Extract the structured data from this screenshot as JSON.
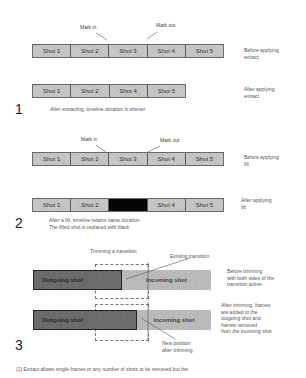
{
  "section1": {
    "number": "1",
    "mark_in": "Mark in",
    "mark_out": "Mark out",
    "before_shots": [
      "Shot 1",
      "Shot 2",
      "Shot 3",
      "Shot 4",
      "Shot 5"
    ],
    "before_label": [
      "Before applying",
      "extract"
    ],
    "after_shots": [
      "Shot 1",
      "Shot 2",
      "Shot 4",
      "Shot 5"
    ],
    "after_label": [
      "After applying",
      "extract"
    ],
    "caption": "After extracting, timeline duration is shorter"
  },
  "section2": {
    "number": "2",
    "mark_in": "Mark in",
    "mark_out": "Mark out",
    "before_shots": [
      "Shot 1",
      "Shot 2",
      "Shot 3",
      "Shot 4",
      "Shot 5"
    ],
    "before_label": [
      "Before applying",
      "lift"
    ],
    "after_shots": [
      "Shot 1",
      "Shot 2",
      "",
      "Shot 4",
      "Shot 5"
    ],
    "after_label": [
      "After applying",
      "lift"
    ],
    "caption": [
      "After a lift, timeline retains same duration",
      "The lifted shot is replaced with black"
    ]
  },
  "section3": {
    "number": "3",
    "trimming_label": "Trimming a transition",
    "existing_label": "Existing transition",
    "outgoing": "Outgoing shot",
    "incoming": "Incoming shot",
    "before_label": [
      "Before trimming",
      "with both sides of the",
      "transition active"
    ],
    "after_label": [
      "After trimming, frames",
      "are added to the",
      "outgoing shot and",
      "frames removed",
      "from the incoming shot"
    ],
    "new_position_label": [
      "New position",
      "after trimming"
    ]
  },
  "footnote": "(1) Extract allows single frames or any number of shots to be removed but the"
}
